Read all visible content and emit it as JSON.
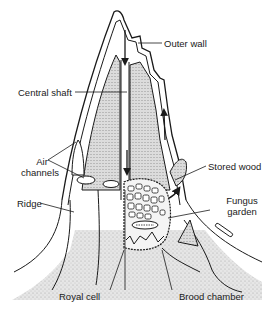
{
  "diagram": {
    "labels": {
      "outer_wall": "Outer wall",
      "central_shaft": "Central shaft",
      "air_channels_line1": "Air",
      "air_channels_line2": "channels",
      "ridge": "Ridge",
      "stored_wood": "Stored wood",
      "fungus_garden_line1": "Fungus",
      "fungus_garden_line2": "garden",
      "royal_cell": "Royal cell",
      "brood_chamber": "Brood chamber"
    },
    "colors": {
      "ink": "#1a1a1a",
      "stipple": "#d4d4d4",
      "stipple_dark": "#bdbdbd",
      "background": "#ffffff"
    }
  }
}
